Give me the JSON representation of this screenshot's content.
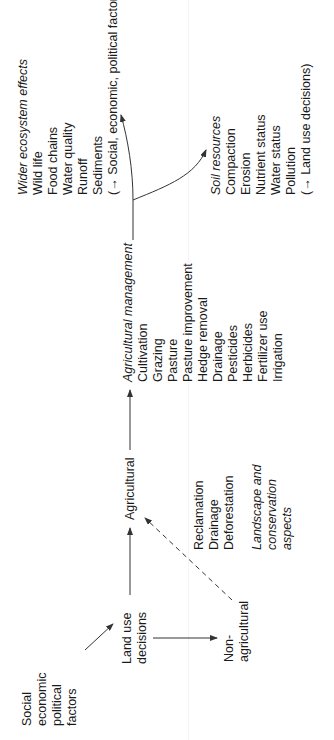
{
  "diagram": {
    "drivers": {
      "lines": [
        "Social",
        "economic",
        "political",
        "factors"
      ]
    },
    "land_use": {
      "lines": [
        "Land use",
        "decisions"
      ]
    },
    "agricultural": {
      "label": "Agricultural"
    },
    "non_agricultural": {
      "lines": [
        "Non-",
        "agricultural"
      ]
    },
    "conversion": {
      "lines": [
        "Reclamation",
        "Drainage",
        "Deforestation"
      ]
    },
    "landscape": {
      "lines": [
        "Landscape and",
        "conservation",
        "aspects"
      ]
    },
    "agricultural_management": {
      "heading": "Agricultural management",
      "items": [
        "Cultivation",
        "Grazing",
        "Pasture",
        "Pasture improvement",
        "Hedge removal",
        "Drainage",
        "Pesticides",
        "Herbicides",
        "Fertilizer use",
        "Irrigation"
      ]
    },
    "wider_ecosystem": {
      "heading": "Wider ecosystem effects",
      "items": [
        "Wild life",
        "Food chains",
        "Water quality",
        "Runoff",
        "Sediments",
        "(→ Social, economic, political factors)"
      ]
    },
    "soil_resources": {
      "heading": "Soil resources",
      "items": [
        "Compaction",
        "Erosion",
        "Nutrient status",
        "Water status",
        "Pollution",
        "(→ Land use decisions)"
      ]
    },
    "colors": {
      "line": "#333333",
      "text": "#1a1a1a"
    }
  }
}
